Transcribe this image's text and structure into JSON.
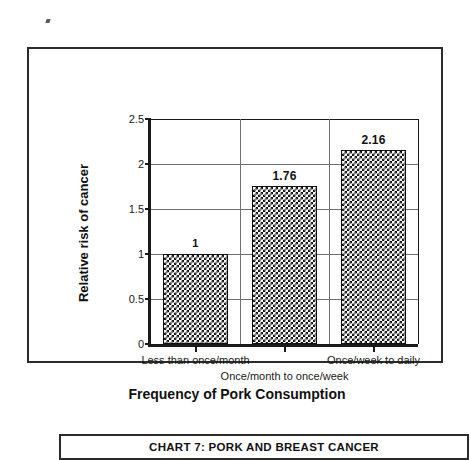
{
  "chart_data": {
    "type": "bar",
    "title": "",
    "xlabel": "Frequency of Pork Consumption",
    "ylabel": "Relative risk of cancer",
    "categories": [
      "Less than once/month",
      "Once/month to once/week",
      "Once/week to daily"
    ],
    "values": [
      1,
      1.76,
      2.16
    ],
    "value_labels": [
      "1",
      "1.76",
      "2.16"
    ],
    "ylim": [
      0,
      2.5
    ],
    "yticks": [
      0,
      0.5,
      1,
      1.5,
      2,
      2.5
    ],
    "ytick_labels": [
      "0",
      "0.5",
      "1",
      "1.5",
      "2",
      "2.5"
    ],
    "grid": "horizontal-and-vertical",
    "legend": "none",
    "series": [
      {
        "name": "Relative risk of cancer",
        "values": [
          1,
          1.76,
          2.16
        ]
      }
    ],
    "bar_fill": "black-white-checkerboard",
    "colors": {
      "bar_pattern_dark": "#111111",
      "bar_pattern_light": "#ffffff",
      "axis": "#1a1a1a",
      "gridline": "#707070",
      "frame": "#2b2b2b"
    }
  },
  "caption": {
    "text": "CHART 7: PORK AND BREAST CANCER"
  }
}
